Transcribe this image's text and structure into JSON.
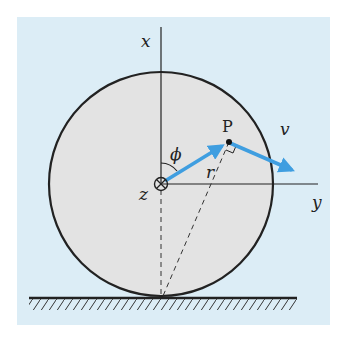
{
  "diagram": {
    "labels": {
      "x_axis": "x",
      "y_axis": "y",
      "z_axis": "z",
      "angle": "ϕ",
      "point": "P",
      "radius": "r",
      "velocity": "v"
    },
    "colors": {
      "background": "#dcedf6",
      "disk": "#e3e3e3",
      "arrow": "#3f9ee0",
      "line": "#222222"
    }
  }
}
